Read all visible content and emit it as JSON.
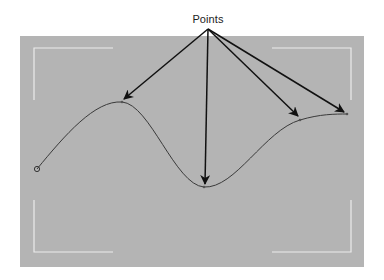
{
  "diagram": {
    "label": "Points",
    "colors": {
      "background": "#b4b4b4",
      "bracket": "#ececec",
      "curve": "#3a3a3a",
      "arrow": "#111111"
    },
    "callout_origin": [
      208,
      29
    ],
    "points": [
      {
        "name": "start-point",
        "x": 37,
        "y": 169,
        "shape": "circle"
      },
      {
        "name": "peak-point",
        "x": 122,
        "y": 102
      },
      {
        "name": "trough-point",
        "x": 204,
        "y": 187
      },
      {
        "name": "rising-point",
        "x": 300,
        "y": 120
      },
      {
        "name": "end-point",
        "x": 347,
        "y": 114
      }
    ]
  }
}
